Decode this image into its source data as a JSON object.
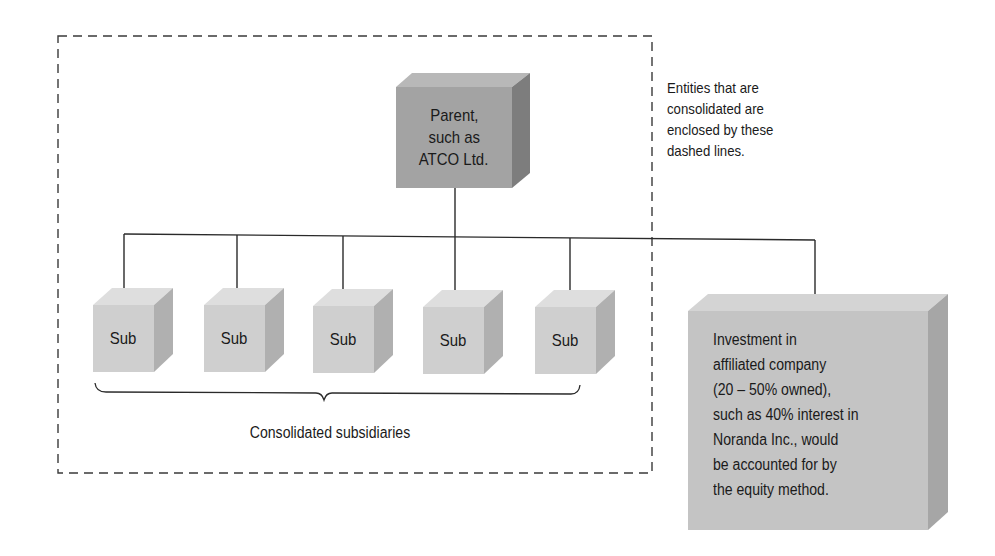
{
  "diagram": {
    "parent": {
      "label_lines": [
        "Parent,",
        "such as",
        "ATCO Ltd."
      ]
    },
    "subsidiaries": [
      {
        "label": "Sub"
      },
      {
        "label": "Sub"
      },
      {
        "label": "Sub"
      },
      {
        "label": "Sub"
      },
      {
        "label": "Sub"
      }
    ],
    "subsidiaries_caption": "Consolidated subsidiaries",
    "dashed_note_lines": [
      "Entities that are",
      "consolidated are",
      "enclosed by these",
      "dashed lines."
    ],
    "affiliate": {
      "text_lines": [
        "Investment in",
        "affiliated company",
        "(20 – 50% owned),",
        "such as 40% interest in",
        "Noranda Inc., would",
        "be accounted for by",
        "the equity method."
      ]
    },
    "colors": {
      "parent_front": "#a3a3a3",
      "parent_top": "#b8b8b8",
      "parent_side": "#7d7d7d",
      "sub_front": "#cfcfcf",
      "sub_top": "#dedede",
      "sub_side": "#b0b0b0",
      "affiliate_front": "#c4c4c4",
      "affiliate_top": "#d4d4d4",
      "affiliate_side": "#a6a6a6",
      "line": "#2a2a2a"
    }
  }
}
